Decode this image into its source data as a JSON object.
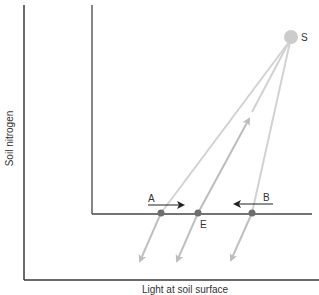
{
  "axes": {
    "y_label": "Soil nitrogen",
    "x_label": "Light at soil surface"
  },
  "labels": {
    "supply_point": "S",
    "point_a": "A",
    "point_b": "B",
    "equilibrium": "E"
  },
  "colors": {
    "axis": "#3a3a3a",
    "zngi": "#444444",
    "consumption_vector": "#c8c8c8",
    "supply_vector": "#b0b0b0",
    "supply_point": "#cccccc",
    "points": "#6e6e6e",
    "arrow": "#222222"
  },
  "elements": {
    "supply_point": {
      "x": 291,
      "y": 37,
      "r": 7
    },
    "points": [
      {
        "name": "A",
        "x": 161,
        "y": 213
      },
      {
        "name": "E",
        "x": 198,
        "y": 213
      },
      {
        "name": "B",
        "x": 252,
        "y": 213
      }
    ]
  }
}
